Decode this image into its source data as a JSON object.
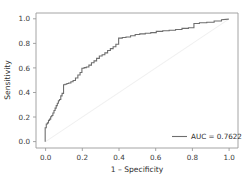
{
  "chart_data": {
    "type": "line",
    "title": "",
    "xlabel": "1 – Specificity",
    "ylabel": "Sensitivity",
    "xlim": [
      -0.05,
      1.05
    ],
    "ylim": [
      -0.05,
      1.05
    ],
    "grid": false,
    "legend_position": "lower right",
    "xticks": [
      "0.0",
      "0.2",
      "0.4",
      "0.6",
      "0.8",
      "1.0"
    ],
    "xtick_values": [
      0.0,
      0.2,
      0.4,
      0.6,
      0.8,
      1.0
    ],
    "yticks": [
      "0.0",
      "0.2",
      "0.4",
      "0.6",
      "0.8",
      "1.0"
    ],
    "ytick_values": [
      0.0,
      0.2,
      0.4,
      0.6,
      0.8,
      1.0
    ],
    "auc": 0.7622,
    "series": [
      {
        "name": "AUC = 0.7622",
        "color": "#6e6e6e",
        "style": "step",
        "x": [
          0.0,
          0.0,
          0.0,
          0.006,
          0.006,
          0.012,
          0.012,
          0.018,
          0.018,
          0.024,
          0.024,
          0.03,
          0.03,
          0.036,
          0.036,
          0.042,
          0.042,
          0.048,
          0.048,
          0.054,
          0.054,
          0.06,
          0.06,
          0.066,
          0.066,
          0.072,
          0.072,
          0.078,
          0.078,
          0.085,
          0.085,
          0.092,
          0.092,
          0.1,
          0.1,
          0.108,
          0.108,
          0.118,
          0.118,
          0.128,
          0.128,
          0.14,
          0.14,
          0.152,
          0.152,
          0.165,
          0.165,
          0.178,
          0.178,
          0.19,
          0.19,
          0.2,
          0.2,
          0.212,
          0.212,
          0.224,
          0.224,
          0.238,
          0.238,
          0.252,
          0.252,
          0.266,
          0.266,
          0.28,
          0.28,
          0.295,
          0.295,
          0.31,
          0.31,
          0.325,
          0.325,
          0.34,
          0.34,
          0.355,
          0.355,
          0.37,
          0.37,
          0.385,
          0.385,
          0.4,
          0.4,
          0.42,
          0.42,
          0.44,
          0.44,
          0.465,
          0.465,
          0.49,
          0.49,
          0.515,
          0.515,
          0.545,
          0.545,
          0.575,
          0.575,
          0.605,
          0.605,
          0.64,
          0.64,
          0.675,
          0.675,
          0.71,
          0.71,
          0.745,
          0.745,
          0.78,
          0.78,
          0.81,
          0.81,
          0.84,
          0.84,
          0.88,
          0.88,
          0.92,
          0.92,
          0.96,
          0.96,
          1.0
        ],
        "y": [
          0.0,
          0.11,
          0.115,
          0.115,
          0.145,
          0.145,
          0.155,
          0.155,
          0.175,
          0.175,
          0.185,
          0.185,
          0.205,
          0.205,
          0.215,
          0.215,
          0.235,
          0.235,
          0.255,
          0.255,
          0.275,
          0.275,
          0.295,
          0.295,
          0.315,
          0.315,
          0.335,
          0.335,
          0.345,
          0.345,
          0.375,
          0.375,
          0.395,
          0.395,
          0.465,
          0.465,
          0.47,
          0.47,
          0.475,
          0.475,
          0.48,
          0.48,
          0.49,
          0.49,
          0.5,
          0.5,
          0.52,
          0.52,
          0.545,
          0.545,
          0.565,
          0.565,
          0.6,
          0.6,
          0.605,
          0.605,
          0.61,
          0.61,
          0.625,
          0.625,
          0.645,
          0.645,
          0.66,
          0.66,
          0.68,
          0.68,
          0.7,
          0.7,
          0.71,
          0.71,
          0.725,
          0.725,
          0.745,
          0.745,
          0.76,
          0.76,
          0.775,
          0.775,
          0.795,
          0.795,
          0.845,
          0.845,
          0.85,
          0.85,
          0.855,
          0.855,
          0.865,
          0.865,
          0.875,
          0.875,
          0.88,
          0.88,
          0.885,
          0.885,
          0.89,
          0.89,
          0.9,
          0.9,
          0.905,
          0.905,
          0.91,
          0.91,
          0.915,
          0.915,
          0.925,
          0.925,
          0.93,
          0.93,
          0.965,
          0.965,
          0.97,
          0.97,
          0.975,
          0.975,
          0.985,
          0.985,
          0.995,
          1.0
        ]
      },
      {
        "name": "chance-diagonal",
        "color": "#f0f0f0",
        "style": "line",
        "x": [
          0.0,
          1.0
        ],
        "y": [
          0.0,
          1.0
        ]
      }
    ]
  },
  "legend": {
    "entries": [
      {
        "label": "AUC = 0.7622",
        "color": "#6e6e6e"
      }
    ]
  },
  "axes": {
    "x_title": "1 – Specificity",
    "y_title": "Sensitivity"
  }
}
